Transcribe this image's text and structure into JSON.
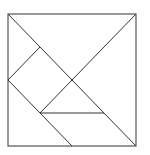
{
  "diagram": {
    "type": "tangram",
    "stroke_color": "#333333",
    "background": "#ffffff",
    "square": {
      "x1": 8,
      "y1": 14,
      "x2": 136,
      "y2": 146
    },
    "lines": [
      {
        "name": "main-diagonal",
        "x1": 8,
        "y1": 14,
        "x2": 136,
        "y2": 146
      },
      {
        "name": "anti-diagonal-segment",
        "x1": 136,
        "y1": 14,
        "x2": 40,
        "y2": 113
      },
      {
        "name": "left-upper-segment",
        "x1": 8,
        "y1": 80,
        "x2": 40,
        "y2": 47
      },
      {
        "name": "left-lower-segment",
        "x1": 8,
        "y1": 80,
        "x2": 72,
        "y2": 146
      },
      {
        "name": "horizontal-segment",
        "x1": 40,
        "y1": 113,
        "x2": 104,
        "y2": 113
      }
    ]
  }
}
